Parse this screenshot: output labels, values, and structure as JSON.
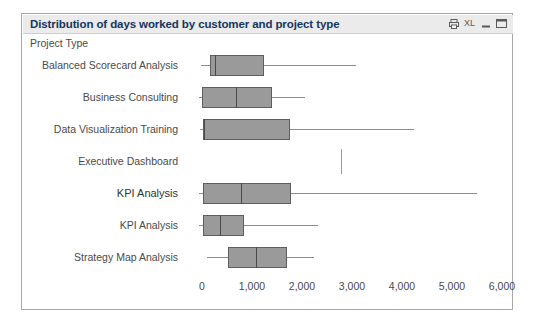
{
  "window": {
    "title": "Distribution of days worked by customer and project type",
    "icons": [
      {
        "name": "print-icon",
        "glyph": "print"
      },
      {
        "name": "excel-export-icon",
        "glyph": "XL"
      },
      {
        "name": "minimize-icon",
        "glyph": "minimize"
      },
      {
        "name": "maximize-icon",
        "glyph": "maximize"
      }
    ]
  },
  "colors": {
    "title_text": "#15355e",
    "titlebar_bg": "#ebebeb",
    "box_fill": "#9a9a9a",
    "box_border": "#5e5e5e",
    "whisker": "#8d8d8d",
    "panel_border": "#a8a8a8",
    "axis_text": "#4a4a4a"
  },
  "chart_data": {
    "type": "box",
    "title": "Distribution of days worked by customer and project type",
    "subtitle": "Project Type",
    "xlabel": "",
    "ylabel": "",
    "orientation": "horizontal",
    "xlim": [
      0,
      6400
    ],
    "grid": false,
    "legend": "none",
    "xticks": [
      0,
      1000,
      2000,
      3000,
      4000,
      5000,
      6000
    ],
    "xtick_labels": [
      "0",
      "1,000",
      "2,000",
      "3,000",
      "4,000",
      "5,000",
      "6,000"
    ],
    "categories": [
      "Balanced Scorecard Analysis",
      "Business Consulting",
      "Data Visualization Training",
      "Executive Dashboard",
      "KPI Analysis",
      "KPI Analysis",
      "Strategy Map Analysis"
    ],
    "boxes": [
      {
        "category": "Balanced Scorecard Analysis",
        "whisker_low": -20,
        "q1": 160,
        "median": 260,
        "q3": 1240,
        "whisker_high": 3080,
        "emphasis": false
      },
      {
        "category": "Business Consulting",
        "whisker_low": -60,
        "q1": 0,
        "median": 680,
        "q3": 1400,
        "whisker_high": 2060,
        "emphasis": false
      },
      {
        "category": "Data Visualization Training",
        "whisker_low": -40,
        "q1": 20,
        "median": 40,
        "q3": 1760,
        "whisker_high": 4240,
        "emphasis": false
      },
      {
        "category": "Executive Dashboard",
        "whisker_low": 2780,
        "q1": 2780,
        "median": 2780,
        "q3": 2780,
        "whisker_high": 2780,
        "emphasis": false,
        "single_line": true
      },
      {
        "category": "KPI Analysis",
        "whisker_low": -60,
        "q1": 20,
        "median": 780,
        "q3": 1780,
        "whisker_high": 5500,
        "emphasis": true
      },
      {
        "category": "KPI Analysis",
        "whisker_low": -60,
        "q1": 20,
        "median": 360,
        "q3": 840,
        "whisker_high": 2320,
        "emphasis": false
      },
      {
        "category": "Strategy Map Analysis",
        "whisker_low": 100,
        "q1": 520,
        "median": 1080,
        "q3": 1700,
        "whisker_high": 2240,
        "emphasis": false
      }
    ]
  }
}
